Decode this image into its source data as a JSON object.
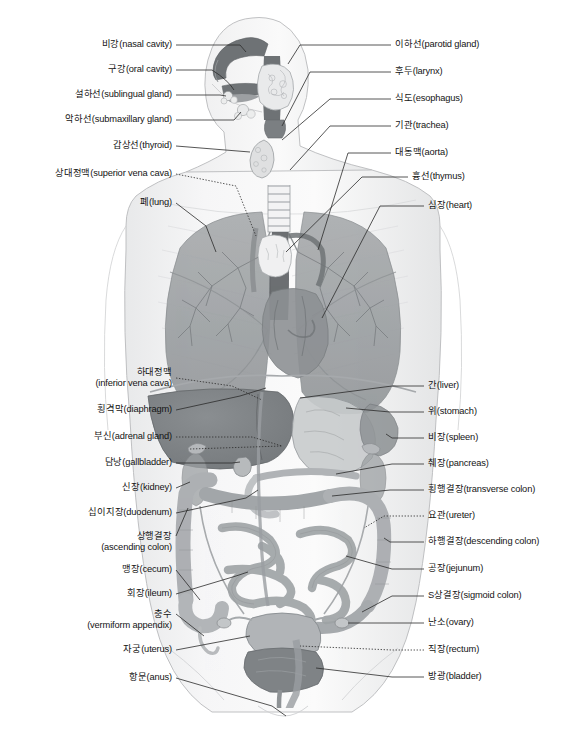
{
  "diagram": {
    "style": "grayscale medical illustration",
    "colors": {
      "background": "#ffffff",
      "body_outline": "#b9babc",
      "skin_fill": "#f2f2f3",
      "organ_dark": "#6f7376",
      "organ_mid": "#9a9da0",
      "organ_light": "#c3c6c8",
      "organ_pale": "#dfe1e2",
      "label_text": "#141414",
      "leader_line": "#2b2b2b"
    },
    "labels_left": [
      {
        "id": "nasal-cavity",
        "ko": "비강",
        "en": "(nasal cavity)",
        "text": "비강(nasal cavity)",
        "x": 172,
        "y": 45,
        "leader": "solid"
      },
      {
        "id": "oral-cavity",
        "ko": "구강",
        "en": "(oral cavity)",
        "text": "구강(oral cavity)",
        "x": 172,
        "y": 70,
        "leader": "solid"
      },
      {
        "id": "sublingual-gland",
        "ko": "설하선",
        "en": "(sublingual gland)",
        "text": "설하선(sublingual gland)",
        "x": 172,
        "y": 95,
        "leader": "solid"
      },
      {
        "id": "submaxillary-gland",
        "ko": "악하선",
        "en": "(submaxillary gland)",
        "text": "악하선(submaxillary gland)",
        "x": 172,
        "y": 120,
        "leader": "solid"
      },
      {
        "id": "thyroid",
        "ko": "갑상선",
        "en": "(thyroid)",
        "text": "갑상선(thyroid)",
        "x": 172,
        "y": 146,
        "leader": "solid"
      },
      {
        "id": "superior-vena-cava",
        "ko": "상대정맥",
        "en": "(superior vena cava)",
        "text": "상대정맥(superior vena cava)",
        "x": 172,
        "y": 174,
        "leader": "dotted"
      },
      {
        "id": "lung",
        "ko": "폐",
        "en": "(lung)",
        "text": "폐(lung)",
        "x": 172,
        "y": 203,
        "leader": "solid"
      },
      {
        "id": "inferior-vena-cava",
        "ko": "하대정맥",
        "en": "(inferior vena cava)",
        "text": "하대정맥",
        "text2": "(inferior vena cava)",
        "x": 172,
        "y": 378,
        "leader": "dotted",
        "lines": 2
      },
      {
        "id": "diaphragm",
        "ko": "횡격막",
        "en": "(diaphragm)",
        "text": "횡격막(diaphragm)",
        "x": 172,
        "y": 410,
        "leader": "solid"
      },
      {
        "id": "adrenal-gland",
        "ko": "부신",
        "en": "(adrenal gland)",
        "text": "부신(adrenal gland)",
        "x": 172,
        "y": 437,
        "leader": "dotted"
      },
      {
        "id": "gallbladder",
        "ko": "담낭",
        "en": "(gallbladder)",
        "text": "담낭(gallbladder)",
        "x": 172,
        "y": 463,
        "leader": "solid"
      },
      {
        "id": "kidney",
        "ko": "신장",
        "en": "(kidney)",
        "text": "신장(kidney)",
        "x": 172,
        "y": 488,
        "leader": "solid"
      },
      {
        "id": "duodenum",
        "ko": "십이지장",
        "en": "(duodenum)",
        "text": "십이지장(duodenum)",
        "x": 172,
        "y": 513,
        "leader": "solid"
      },
      {
        "id": "ascending-colon",
        "ko": "상행결장",
        "en": "(ascending colon)",
        "text": "상행결장",
        "text2": "(ascending colon)",
        "x": 172,
        "y": 542,
        "leader": "solid",
        "lines": 2
      },
      {
        "id": "cecum",
        "ko": "맹장",
        "en": "(cecum)",
        "text": "맹장(cecum)",
        "x": 172,
        "y": 570,
        "leader": "solid"
      },
      {
        "id": "ileum",
        "ko": "회장",
        "en": "(ileum)",
        "text": "회장(ileum)",
        "x": 172,
        "y": 594,
        "leader": "solid"
      },
      {
        "id": "vermiform-appendix",
        "ko": "충수",
        "en": "(vermiform appendix)",
        "text": "충수",
        "text2": "(vermiform appendix)",
        "x": 172,
        "y": 620,
        "leader": "solid",
        "lines": 2
      },
      {
        "id": "uterus",
        "ko": "자궁",
        "en": "(uterus)",
        "text": "자궁(uterus)",
        "x": 172,
        "y": 650,
        "leader": "solid"
      },
      {
        "id": "anus",
        "ko": "항문",
        "en": "(anus)",
        "text": "항문(anus)",
        "x": 172,
        "y": 678,
        "leader": "solid"
      }
    ],
    "labels_right": [
      {
        "id": "parotid-gland",
        "ko": "이하선",
        "en": "(parotid gland)",
        "text": "이하선(parotid gland)",
        "x": 395,
        "y": 45,
        "leader": "solid"
      },
      {
        "id": "larynx",
        "ko": "후두",
        "en": "(larynx)",
        "text": "후두(larynx)",
        "x": 395,
        "y": 72,
        "leader": "solid"
      },
      {
        "id": "esophagus",
        "ko": "식도",
        "en": "(esophagus)",
        "text": "식도(esophagus)",
        "x": 395,
        "y": 99,
        "leader": "solid"
      },
      {
        "id": "trachea",
        "ko": "기관",
        "en": "(trachea)",
        "text": "기관(trachea)",
        "x": 395,
        "y": 126,
        "leader": "solid"
      },
      {
        "id": "aorta",
        "ko": "대동맥",
        "en": "(aorta)",
        "text": "대동맥(aorta)",
        "x": 395,
        "y": 153,
        "leader": "solid"
      },
      {
        "id": "thymus",
        "ko": "흉선",
        "en": "(thymus)",
        "text": "흉선(thymus)",
        "x": 412,
        "y": 177,
        "leader": "solid"
      },
      {
        "id": "heart",
        "ko": "심장",
        "en": "(heart)",
        "text": "심장(heart)",
        "x": 428,
        "y": 206,
        "leader": "solid"
      },
      {
        "id": "liver",
        "ko": "간",
        "en": "(liver)",
        "text": "간(liver)",
        "x": 428,
        "y": 386,
        "leader": "solid"
      },
      {
        "id": "stomach",
        "ko": "위",
        "en": "(stomach)",
        "text": "위(stomach)",
        "x": 428,
        "y": 412,
        "leader": "solid"
      },
      {
        "id": "spleen",
        "ko": "비장",
        "en": "(spleen)",
        "text": "비장(spleen)",
        "x": 428,
        "y": 438,
        "leader": "solid"
      },
      {
        "id": "pancreas",
        "ko": "췌장",
        "en": "(pancreas)",
        "text": "췌장(pancreas)",
        "x": 428,
        "y": 464,
        "leader": "solid"
      },
      {
        "id": "transverse-colon",
        "ko": "횡행결장",
        "en": "(transverse colon)",
        "text": "횡행결장(transverse colon)",
        "x": 428,
        "y": 490,
        "leader": "solid"
      },
      {
        "id": "ureter",
        "ko": "요관",
        "en": "(ureter)",
        "text": "요관(ureter)",
        "x": 428,
        "y": 516,
        "leader": "dotted"
      },
      {
        "id": "descending-colon",
        "ko": "하행결장",
        "en": "(descending colon)",
        "text": "하행결장(descending colon)",
        "x": 428,
        "y": 542,
        "leader": "solid"
      },
      {
        "id": "jejunum",
        "ko": "공장",
        "en": "(jejunum)",
        "text": "공장(jejunum)",
        "x": 428,
        "y": 569,
        "leader": "solid"
      },
      {
        "id": "sigmoid-colon",
        "ko": "S상결장",
        "en": "(sigmoid colon)",
        "text": "S상결장(sigmoid colon)",
        "x": 428,
        "y": 596,
        "leader": "solid"
      },
      {
        "id": "ovary",
        "ko": "난소",
        "en": "(ovary)",
        "text": "난소(ovary)",
        "x": 428,
        "y": 623,
        "leader": "solid"
      },
      {
        "id": "rectum",
        "ko": "직장",
        "en": "(rectum)",
        "text": "직장(rectum)",
        "x": 428,
        "y": 650,
        "leader": "dotted"
      },
      {
        "id": "bladder",
        "ko": "방광",
        "en": "(bladder)",
        "text": "방광(bladder)",
        "x": 428,
        "y": 677,
        "leader": "solid"
      }
    ]
  }
}
